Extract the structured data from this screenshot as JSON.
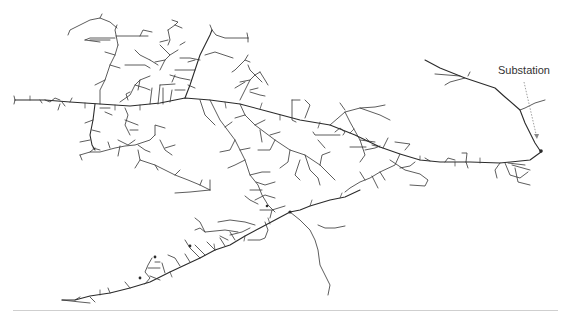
{
  "diagram": {
    "type": "distribution-network-topology",
    "annotations": [
      {
        "text": "Substation",
        "x": 495,
        "y": 70
      }
    ],
    "colors": {
      "lines": "#2b2b2b",
      "annotation_text": "#333333",
      "arrow": "#888888",
      "divider": "#cfcfcf",
      "background": "#ffffff"
    }
  }
}
